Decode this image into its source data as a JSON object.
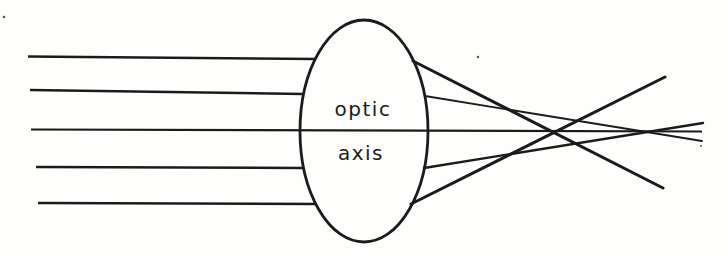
{
  "lens": {
    "label_line1": "optic",
    "label_line2": "axis"
  },
  "colors": {
    "ink": "#1b1b1b",
    "background": "#fefefd"
  },
  "diagram": {
    "type": "lens-ray-diagram-spherical-aberration",
    "canvas": {
      "width": 728,
      "height": 256
    },
    "lens_ellipse": {
      "cx": 364,
      "cy": 131,
      "rx": 64,
      "ry": 111,
      "stroke_width": 2.8
    },
    "optic_axis": {
      "x1": 31,
      "y1": 129.5,
      "x2": 702,
      "y2": 131.5,
      "stroke_width": 2.2
    },
    "incident_rays": [
      {
        "x1": 28,
        "y1": 56.5,
        "x2": 315,
        "y2": 59,
        "stroke_width": 2.6
      },
      {
        "x1": 30,
        "y1": 90,
        "x2": 303,
        "y2": 94,
        "stroke_width": 2.6
      },
      {
        "x1": 36,
        "y1": 167,
        "x2": 304,
        "y2": 168,
        "stroke_width": 2.6
      },
      {
        "x1": 38,
        "y1": 203,
        "x2": 317,
        "y2": 204,
        "stroke_width": 2.6
      }
    ],
    "refracted_rays": [
      {
        "x1": 413,
        "y1": 61,
        "x2": 663,
        "y2": 188,
        "stroke_width": 3.0
      },
      {
        "x1": 425,
        "y1": 96,
        "x2": 702,
        "y2": 141,
        "stroke_width": 1.8
      },
      {
        "x1": 424,
        "y1": 168,
        "x2": 703,
        "y2": 123,
        "stroke_width": 2.4
      },
      {
        "x1": 411,
        "y1": 204,
        "x2": 665,
        "y2": 77,
        "stroke_width": 3.0
      }
    ],
    "noise_specks": [
      {
        "cx": 478,
        "cy": 57,
        "r": 1.2
      },
      {
        "cx": 701,
        "cy": 146,
        "r": 1.0
      },
      {
        "cx": 4,
        "cy": 17,
        "r": 1.3
      }
    ]
  }
}
